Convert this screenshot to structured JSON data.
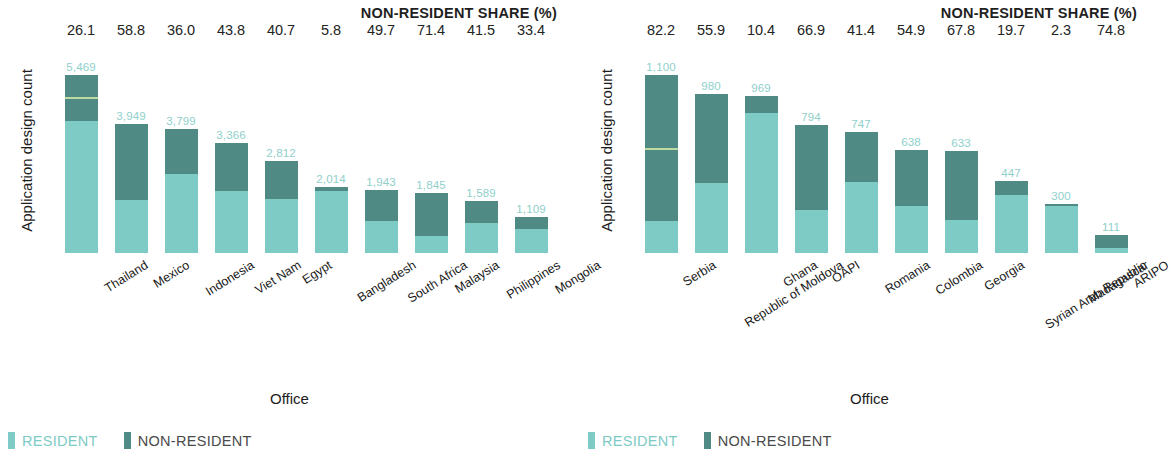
{
  "colors": {
    "resident": "#7ecac5",
    "non_resident": "#4f8a84",
    "value_label": "#8fd0cb",
    "text": "#1c1c1c"
  },
  "panels": [
    {
      "id": "left",
      "share_header": "NON-RESIDENT SHARE (%)",
      "y_axis_title": "Application design count",
      "x_axis_title": "Office",
      "legend": {
        "resident": "RESIDENT",
        "non_resident": "NON-RESIDENT"
      },
      "categories": [
        "Thailand",
        "Mexico",
        "Indonesia",
        "Viet Nam",
        "Egypt",
        "Bangladesh",
        "South Africa",
        "Malaysia",
        "Philippines",
        "Mongolia"
      ],
      "totals_text": [
        "5,469",
        "3,949",
        "3,799",
        "3,366",
        "2,812",
        "2,014",
        "1,943",
        "1,845",
        "1,589",
        "1,109"
      ],
      "shares_text": [
        "26.1",
        "58.8",
        "36.0",
        "43.8",
        "40.7",
        "5.8",
        "49.7",
        "71.4",
        "41.5",
        "33.4"
      ]
    },
    {
      "id": "right",
      "share_header": "NON-RESIDENT SHARE (%)",
      "y_axis_title": "Application design count",
      "x_axis_title": "Office",
      "legend": {
        "resident": "RESIDENT",
        "non_resident": "NON-RESIDENT"
      },
      "categories": [
        "Serbia",
        "Republic of Moldova",
        "Ghana",
        "OAPI",
        "Romania",
        "Colombia",
        "Georgia",
        "Syrian Arab Republic",
        "Madagascar",
        "ARIPO"
      ],
      "totals_text": [
        "1,100",
        "980",
        "969",
        "794",
        "747",
        "638",
        "633",
        "447",
        "300",
        "111"
      ],
      "shares_text": [
        "82.2",
        "55.9",
        "10.4",
        "66.9",
        "41.4",
        "54.9",
        "67.8",
        "19.7",
        "2.3",
        "74.8"
      ]
    }
  ],
  "chart_data": [
    {
      "type": "bar",
      "subtype": "stacked-bar",
      "title": "NON-RESIDENT SHARE (%)",
      "xlabel": "Office",
      "ylabel": "Application design count",
      "grid": false,
      "legend_position": "bottom-left",
      "ylim": [
        0,
        5469
      ],
      "categories": [
        "Thailand",
        "Mexico",
        "Indonesia",
        "Viet Nam",
        "Egypt",
        "Bangladesh",
        "South Africa",
        "Malaysia",
        "Philippines",
        "Mongolia"
      ],
      "totals": [
        5469,
        3949,
        3799,
        3366,
        2812,
        2014,
        1943,
        1845,
        1589,
        1109
      ],
      "non_resident_share_pct": [
        26.1,
        58.8,
        36.0,
        43.8,
        40.7,
        5.8,
        49.7,
        71.4,
        41.5,
        33.4
      ],
      "series": [
        {
          "name": "RESIDENT",
          "color": "#7ecac5",
          "values": [
            4042,
            1627,
            2431,
            1892,
            1667,
            1897,
            977,
            528,
            929,
            739
          ]
        },
        {
          "name": "NON-RESIDENT",
          "color": "#4f8a84",
          "values": [
            1427,
            2322,
            1368,
            1474,
            1145,
            117,
            966,
            1317,
            660,
            370
          ]
        }
      ]
    },
    {
      "type": "bar",
      "subtype": "stacked-bar",
      "title": "NON-RESIDENT SHARE (%)",
      "xlabel": "Office",
      "ylabel": "Application design count",
      "grid": false,
      "legend_position": "bottom-left",
      "ylim": [
        0,
        1100
      ],
      "categories": [
        "Serbia",
        "Republic of Moldova",
        "Ghana",
        "OAPI",
        "Romania",
        "Colombia",
        "Georgia",
        "Syrian Arab Republic",
        "Madagascar",
        "ARIPO"
      ],
      "totals": [
        1100,
        980,
        969,
        794,
        747,
        638,
        633,
        447,
        300,
        111
      ],
      "non_resident_share_pct": [
        82.2,
        55.9,
        10.4,
        66.9,
        41.4,
        54.9,
        67.8,
        19.7,
        2.3,
        74.8
      ],
      "series": [
        {
          "name": "RESIDENT",
          "color": "#7ecac5",
          "values": [
            196,
            432,
            868,
            263,
            438,
            288,
            204,
            359,
            293,
            28
          ]
        },
        {
          "name": "NON-RESIDENT",
          "color": "#4f8a84",
          "values": [
            904,
            548,
            101,
            531,
            309,
            350,
            429,
            88,
            7,
            83
          ]
        }
      ]
    }
  ]
}
